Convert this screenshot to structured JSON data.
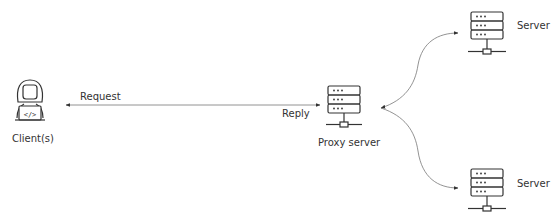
{
  "diagram": {
    "client": {
      "label": "Client(s)"
    },
    "proxy": {
      "label": "Proxy server"
    },
    "servers": [
      {
        "label": "Server"
      },
      {
        "label": "Server"
      }
    ],
    "edges": {
      "request": "Request",
      "reply": "Reply"
    },
    "colors": {
      "line": "#666666",
      "icon": "#333333",
      "background": "#ffffff"
    }
  }
}
